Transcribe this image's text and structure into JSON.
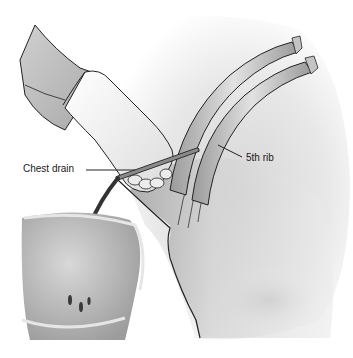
{
  "figure": {
    "labels": [
      {
        "id": "chest-drain",
        "text": "Chest drain"
      },
      {
        "id": "fifth-rib",
        "text": "5th rib"
      }
    ],
    "colors": {
      "background": "#ffffff",
      "skin_shadow": "#8a8a8a",
      "skin_light": "#e6e6e6",
      "rib_fill": "#c8c8c8",
      "glove": "#f2f2f2",
      "outline": "#1f1f1f",
      "drain_tube": "#555555",
      "fluid": "#3a3a3a",
      "bucket": "#b5b5b5"
    }
  }
}
